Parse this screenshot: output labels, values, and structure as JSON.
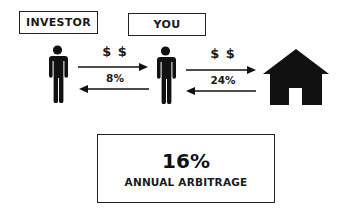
{
  "nodes": {
    "investor": {
      "label": "INVESTOR",
      "icon": "person-icon"
    },
    "you": {
      "label": "YOU",
      "icon": "person-icon"
    },
    "property": {
      "icon": "house-icon"
    }
  },
  "flows": [
    {
      "from": "investor",
      "to": "you",
      "top_label": "$ $",
      "bottom_label": "8%"
    },
    {
      "from": "you",
      "to": "property",
      "top_label": "$ $",
      "bottom_label": "24%"
    }
  ],
  "result": {
    "value": "16%",
    "label": "ANNUAL ARBITRAGE"
  },
  "colors": {
    "ink": "#111111",
    "background": "#ffffff",
    "border": "#222222"
  }
}
